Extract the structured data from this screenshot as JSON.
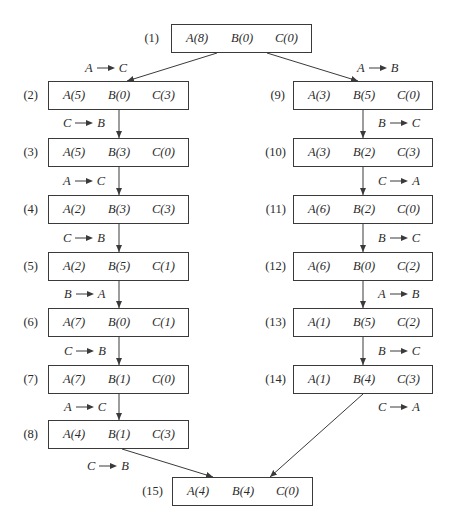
{
  "figure": {
    "nodes": [
      {
        "label": "(1)",
        "a": "A(8)",
        "b": "B(0)",
        "c": "C(0)"
      },
      {
        "label": "(2)",
        "a": "A(5)",
        "b": "B(0)",
        "c": "C(3)"
      },
      {
        "label": "(3)",
        "a": "A(5)",
        "b": "B(3)",
        "c": "C(0)"
      },
      {
        "label": "(4)",
        "a": "A(2)",
        "b": "B(3)",
        "c": "C(3)"
      },
      {
        "label": "(5)",
        "a": "A(2)",
        "b": "B(5)",
        "c": "C(1)"
      },
      {
        "label": "(6)",
        "a": "A(7)",
        "b": "B(0)",
        "c": "C(1)"
      },
      {
        "label": "(7)",
        "a": "A(7)",
        "b": "B(1)",
        "c": "C(0)"
      },
      {
        "label": "(8)",
        "a": "A(4)",
        "b": "B(1)",
        "c": "C(3)"
      },
      {
        "label": "(9)",
        "a": "A(3)",
        "b": "B(5)",
        "c": "C(0)"
      },
      {
        "label": "(10)",
        "a": "A(3)",
        "b": "B(2)",
        "c": "C(3)"
      },
      {
        "label": "(11)",
        "a": "A(6)",
        "b": "B(2)",
        "c": "C(0)"
      },
      {
        "label": "(12)",
        "a": "A(6)",
        "b": "B(0)",
        "c": "C(2)"
      },
      {
        "label": "(13)",
        "a": "A(1)",
        "b": "B(5)",
        "c": "C(2)"
      },
      {
        "label": "(14)",
        "a": "A(1)",
        "b": "B(4)",
        "c": "C(3)"
      },
      {
        "label": "(15)",
        "a": "A(4)",
        "b": "B(4)",
        "c": "C(0)"
      }
    ],
    "moves": {
      "m1_2": {
        "from": "A",
        "to": "C"
      },
      "m2_3": {
        "from": "C",
        "to": "B"
      },
      "m3_4": {
        "from": "A",
        "to": "C"
      },
      "m4_5": {
        "from": "C",
        "to": "B"
      },
      "m5_6": {
        "from": "B",
        "to": "A"
      },
      "m6_7": {
        "from": "C",
        "to": "B"
      },
      "m7_8": {
        "from": "A",
        "to": "C"
      },
      "m8_15": {
        "from": "C",
        "to": "B"
      },
      "m1_9": {
        "from": "A",
        "to": "B"
      },
      "m9_10": {
        "from": "B",
        "to": "C"
      },
      "m10_11": {
        "from": "C",
        "to": "A"
      },
      "m11_12": {
        "from": "B",
        "to": "C"
      },
      "m12_13": {
        "from": "A",
        "to": "B"
      },
      "m13_14": {
        "from": "B",
        "to": "C"
      },
      "m14_15": {
        "from": "C",
        "to": "A"
      }
    },
    "colors": {
      "line": "#3a3a3a",
      "text": "#2b2b2b"
    }
  }
}
